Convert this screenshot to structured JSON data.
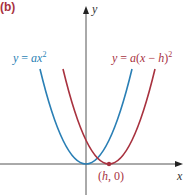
{
  "panel_label": "(b)",
  "axes": {
    "x_label": "x",
    "y_label": "y",
    "origin_px": [
      86,
      164
    ]
  },
  "curves": [
    {
      "name": "base-parabola",
      "equation": "y = ax²",
      "label_parts": {
        "lhs": "y",
        "eq": " = ",
        "a": "a",
        "x": "x",
        "exp": "2"
      },
      "color": "#2a7fb5",
      "vertex_px": [
        86,
        164
      ],
      "vertex": [
        0,
        0
      ]
    },
    {
      "name": "shifted-parabola",
      "equation": "y = a(x − h)²",
      "label_parts": {
        "lhs": "y",
        "eq": " = ",
        "a": "a",
        "open": "(",
        "x": "x",
        "minus": " − ",
        "h": "h",
        "close": ")",
        "exp": "2"
      },
      "color": "#a8323f",
      "vertex_px": [
        109,
        164
      ],
      "vertex": [
        "h",
        0
      ]
    }
  ],
  "vertex_annotation": {
    "text": "(h, 0)",
    "open": "(",
    "h": "h",
    "rest": ", 0)",
    "color": "#a8323f"
  },
  "colors": {
    "axis": "#555555",
    "blue": "#2a7fb5",
    "red": "#a8323f"
  }
}
